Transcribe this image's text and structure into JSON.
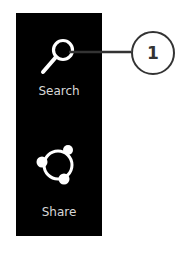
{
  "charms": [
    {
      "label": "Search",
      "icon": "search-icon"
    },
    {
      "label": "Share",
      "icon": "share-icon"
    }
  ],
  "callout": {
    "number": "1",
    "target": "Search"
  },
  "colors": {
    "bar_background": "#000000",
    "icon": "#ffffff",
    "label": "#d8d8d8",
    "callout_stroke": "#333333"
  }
}
